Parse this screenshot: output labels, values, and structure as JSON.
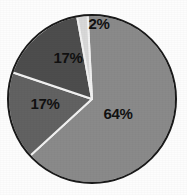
{
  "chart_data": {
    "type": "pie",
    "title": "",
    "subtitle": "",
    "xlabel": "",
    "ylabel": "",
    "legend": "none",
    "grid": false,
    "labels_shown": "percent",
    "start_angle_deg": -3,
    "direction": "clockwise",
    "center": {
      "x": 92,
      "y": 99
    },
    "radius": 84,
    "categories": [
      "Segment 1",
      "Segment 2",
      "Segment 3",
      "Segment 4"
    ],
    "values": [
      64,
      17,
      17,
      2
    ],
    "value_labels": [
      "64%",
      "17%",
      "17%",
      "2%"
    ],
    "colors": [
      "#8a8a8a",
      "#626262",
      "#4d4d4d",
      "#d8d8d8"
    ],
    "outline_color": "#1a1a1a",
    "separator_color": "#f2f2f2",
    "background_color": "#fdfdfd",
    "label_color": "#111111",
    "slices": [
      {
        "name": "slice-64",
        "label": "64%",
        "value": 64,
        "color": "#8a8a8a",
        "start_deg": -3,
        "end_deg": 227.4,
        "label_x": 118,
        "label_y": 115
      },
      {
        "name": "slice-17-lower",
        "label": "17%",
        "value": 17,
        "color": "#626262",
        "start_deg": 227.4,
        "end_deg": 288.6,
        "label_x": 45,
        "label_y": 105
      },
      {
        "name": "slice-17-upper",
        "label": "17%",
        "value": 17,
        "color": "#4d4d4d",
        "start_deg": 288.6,
        "end_deg": 349.8,
        "label_x": 68,
        "label_y": 59
      },
      {
        "name": "slice-2",
        "label": "2%",
        "value": 2,
        "color": "#d8d8d8",
        "start_deg": 349.8,
        "end_deg": 357,
        "label_x": 99,
        "label_y": 25
      }
    ]
  }
}
